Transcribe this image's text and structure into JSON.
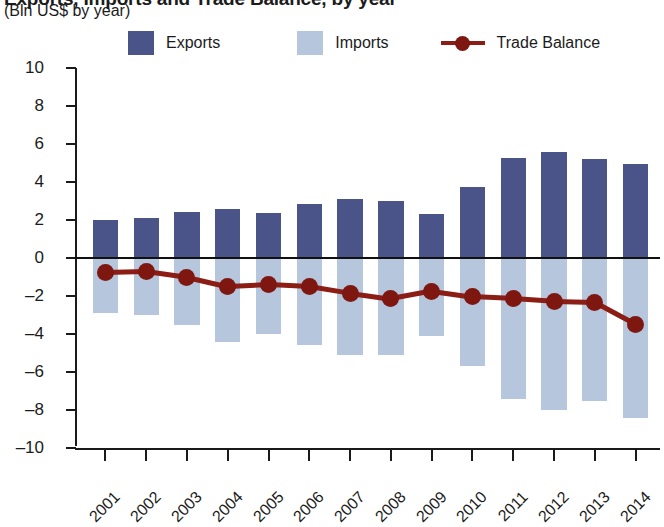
{
  "title": {
    "main": "Exports, Imports and Trade Balance, by year",
    "sub": "(Bln US$ by year)"
  },
  "legend": {
    "exports_label": "Exports",
    "imports_label": "Imports",
    "balance_label": "Trade Balance"
  },
  "colors": {
    "exports": "#4b5488",
    "imports": "#b6c6dd",
    "balance": "#8c1d15",
    "balance_marker": "#7d1710",
    "axis": "#1a1a1a"
  },
  "chart_data": {
    "type": "bar",
    "title": "Exports, Imports and Trade Balance, by year",
    "subtitle": "(Bln US$ by year)",
    "xlabel": "",
    "ylabel": "Bln US$",
    "ylim": [
      -10,
      10
    ],
    "ytick_step": 2,
    "yticks": [
      10,
      8,
      6,
      4,
      2,
      0,
      -2,
      -4,
      -6,
      -8,
      -10
    ],
    "grid": false,
    "legend_position": "top",
    "categories": [
      "2001",
      "2002",
      "2003",
      "2004",
      "2005",
      "2006",
      "2007",
      "2008",
      "2009",
      "2010",
      "2011",
      "2012",
      "2013",
      "2014"
    ],
    "series": [
      {
        "name": "Exports",
        "type": "bar",
        "color": "#4b5488",
        "values": [
          2.0,
          2.1,
          2.4,
          2.6,
          2.35,
          2.85,
          3.1,
          3.0,
          2.3,
          3.75,
          5.25,
          5.6,
          5.2,
          4.95
        ]
      },
      {
        "name": "Imports",
        "type": "bar",
        "color": "#b6c6dd",
        "values": [
          -2.9,
          -3.0,
          -3.5,
          -4.4,
          -4.0,
          -4.6,
          -5.1,
          -5.1,
          -4.1,
          -5.7,
          -7.4,
          -8.0,
          -7.55,
          -8.4
        ]
      },
      {
        "name": "Trade Balance",
        "type": "line",
        "color": "#8c1d15",
        "values": [
          -0.75,
          -0.7,
          -1.0,
          -1.5,
          -1.4,
          -1.5,
          -1.85,
          -2.15,
          -1.75,
          -2.05,
          -2.15,
          -2.3,
          -2.35,
          -3.5
        ]
      }
    ]
  }
}
